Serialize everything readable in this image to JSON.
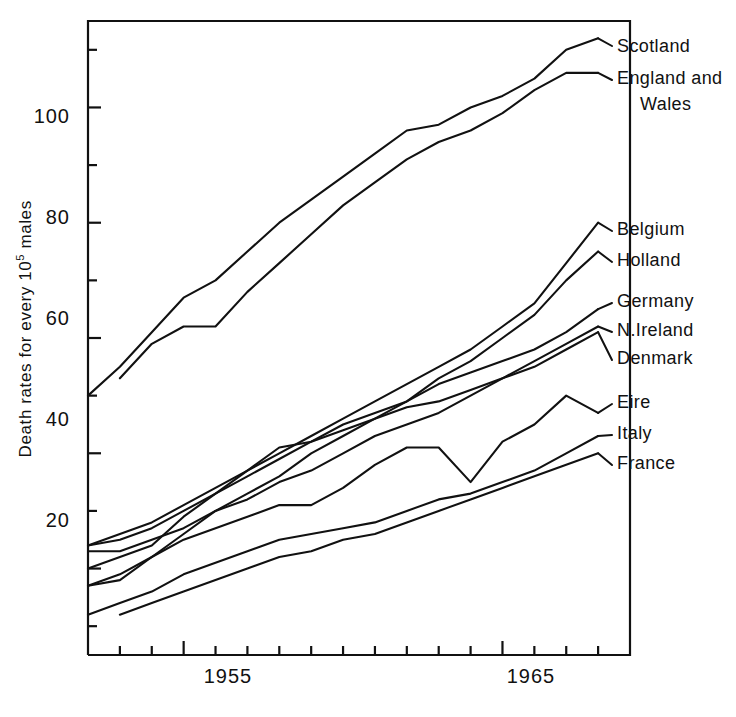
{
  "chart_data": {
    "type": "line",
    "title": "",
    "xlabel": "",
    "ylabel": "Death rates for every 10^5 males",
    "ylabel_prefix": "Death rates for every 10",
    "ylabel_exponent": "5",
    "ylabel_suffix": " males",
    "xlim": [
      1952,
      1969
    ],
    "ylim": [
      5,
      115
    ],
    "grid": false,
    "legend_position": "right-inline",
    "line_color": "#111111",
    "background_color": "#ffffff",
    "yticks_major": [
      20,
      40,
      60,
      80,
      100
    ],
    "yticks_minor": [
      10,
      30,
      50,
      70,
      90,
      110
    ],
    "ytick_labels": [
      "20",
      "40",
      "60",
      "80",
      "100"
    ],
    "xticks": [
      1953,
      1954,
      1955,
      1956,
      1957,
      1958,
      1959,
      1960,
      1961,
      1962,
      1963,
      1964,
      1965,
      1966,
      1967,
      1968
    ],
    "xtick_labels": [
      "1955",
      "1965"
    ],
    "xtick_labeled_values": [
      1955,
      1965
    ],
    "series": [
      {
        "name": "Scotland",
        "label": "Scotland",
        "x": [
          1952,
          1953,
          1954,
          1955,
          1956,
          1957,
          1958,
          1959,
          1960,
          1961,
          1962,
          1963,
          1964,
          1965,
          1966,
          1967,
          1968
        ],
        "values": [
          50,
          55,
          61,
          67,
          70,
          75,
          80,
          84,
          88,
          92,
          96,
          97,
          100,
          102,
          105,
          110,
          112
        ]
      },
      {
        "name": "England and Wales",
        "label": "England and",
        "label_line2": "Wales",
        "x": [
          1953,
          1954,
          1955,
          1956,
          1957,
          1958,
          1959,
          1960,
          1961,
          1962,
          1963,
          1964,
          1965,
          1966,
          1967,
          1968
        ],
        "values": [
          53,
          59,
          62,
          62,
          68,
          73,
          78,
          83,
          87,
          91,
          94,
          96,
          99,
          103,
          106,
          106
        ]
      },
      {
        "name": "Belgium",
        "label": "Belgium",
        "x": [
          1952,
          1953,
          1954,
          1955,
          1956,
          1957,
          1958,
          1959,
          1960,
          1961,
          1962,
          1963,
          1964,
          1965,
          1966,
          1967,
          1968
        ],
        "values": [
          24,
          26,
          28,
          31,
          34,
          37,
          40,
          43,
          46,
          49,
          52,
          55,
          58,
          62,
          66,
          73,
          80
        ]
      },
      {
        "name": "Holland",
        "label": "Holland",
        "x": [
          1952,
          1953,
          1954,
          1955,
          1956,
          1957,
          1958,
          1959,
          1960,
          1961,
          1962,
          1963,
          1964,
          1965,
          1966,
          1967,
          1968
        ],
        "values": [
          23,
          23,
          25,
          27,
          30,
          33,
          36,
          40,
          43,
          46,
          49,
          53,
          56,
          60,
          64,
          70,
          75
        ]
      },
      {
        "name": "Germany",
        "label": "Germany",
        "x": [
          1952,
          1953,
          1954,
          1955,
          1956,
          1957,
          1958,
          1959,
          1960,
          1961,
          1962,
          1963,
          1964,
          1965,
          1966,
          1967,
          1968
        ],
        "values": [
          24,
          25,
          27,
          30,
          33,
          36,
          39,
          42,
          45,
          47,
          49,
          52,
          54,
          56,
          58,
          61,
          65
        ]
      },
      {
        "name": "N.Ireland",
        "label": "N.Ireland",
        "x": [
          1952,
          1953,
          1954,
          1955,
          1956,
          1957,
          1958,
          1959,
          1960,
          1961,
          1962,
          1963,
          1964,
          1965,
          1966,
          1967,
          1968
        ],
        "values": [
          20,
          22,
          24,
          29,
          33,
          37,
          41,
          42,
          44,
          46,
          48,
          49,
          51,
          53,
          56,
          59,
          62
        ]
      },
      {
        "name": "Denmark",
        "label": "Denmark",
        "x": [
          1952,
          1953,
          1954,
          1955,
          1956,
          1957,
          1958,
          1959,
          1960,
          1961,
          1962,
          1963,
          1964,
          1965,
          1966,
          1967,
          1968
        ],
        "values": [
          17,
          19,
          22,
          26,
          30,
          32,
          35,
          37,
          40,
          43,
          45,
          47,
          50,
          53,
          55,
          58,
          61
        ]
      },
      {
        "name": "Eire",
        "label": "Eire",
        "x": [
          1952,
          1953,
          1954,
          1955,
          1956,
          1957,
          1958,
          1959,
          1960,
          1961,
          1962,
          1963,
          1964,
          1965,
          1966,
          1967,
          1968
        ],
        "values": [
          17,
          18,
          22,
          25,
          27,
          29,
          31,
          31,
          34,
          38,
          41,
          41,
          35,
          42,
          45,
          50,
          47
        ]
      },
      {
        "name": "Italy",
        "label": "Italy",
        "x": [
          1952,
          1953,
          1954,
          1955,
          1956,
          1957,
          1958,
          1959,
          1960,
          1961,
          1962,
          1963,
          1964,
          1965,
          1966,
          1967,
          1968
        ],
        "values": [
          12,
          14,
          16,
          19,
          21,
          23,
          25,
          26,
          27,
          28,
          30,
          32,
          33,
          35,
          37,
          40,
          43
        ]
      },
      {
        "name": "France",
        "label": "France",
        "x": [
          1953,
          1954,
          1955,
          1956,
          1957,
          1958,
          1959,
          1960,
          1961,
          1962,
          1963,
          1964,
          1965,
          1966,
          1967,
          1968
        ],
        "values": [
          12,
          14,
          16,
          18,
          20,
          22,
          23,
          25,
          26,
          28,
          30,
          32,
          34,
          36,
          38,
          40
        ]
      }
    ]
  },
  "labels": {
    "scotland": "Scotland",
    "england_line1": "England and",
    "england_line2": "Wales",
    "belgium": "Belgium",
    "holland": "Holland",
    "germany": "Germany",
    "nireland": "N.Ireland",
    "denmark": "Denmark",
    "eire": "Eire",
    "italy": "Italy",
    "france": "France"
  },
  "ticks": {
    "y": [
      "100",
      "80",
      "60",
      "40",
      "20"
    ],
    "x": [
      "1955",
      "1965"
    ]
  }
}
